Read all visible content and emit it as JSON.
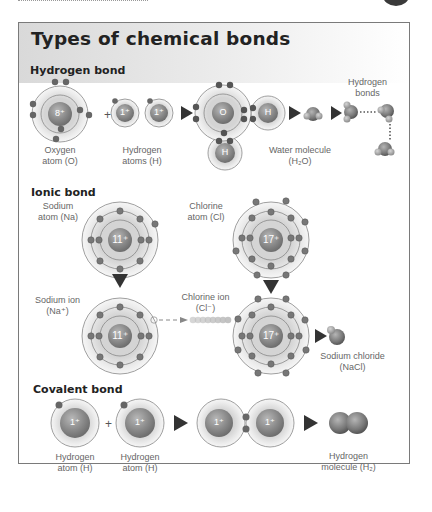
{
  "title": "Types of chemical bonds",
  "sections": {
    "hydrogen": {
      "heading": "Hydrogen bond",
      "labels": {
        "oxygen_atom": [
          "Oxygen",
          "atom (O)"
        ],
        "hydrogen_atoms": [
          "Hydrogen",
          "atoms (H)"
        ],
        "water_molecule": [
          "Water molecule",
          "(H₂O)"
        ],
        "hydrogen_bonds": [
          "Hydrogen",
          "bonds"
        ]
      },
      "nuclei": {
        "oxygen": "8⁺",
        "hydrogen1": "1⁺",
        "hydrogen2": "1⁺",
        "o": "O",
        "h_right": "H",
        "h_bottom": "H"
      },
      "operator": "+"
    },
    "ionic": {
      "heading": "Ionic bond",
      "labels": {
        "sodium_atom": [
          "Sodium",
          "atom (Na)"
        ],
        "chlorine_atom": [
          "Chlorine",
          "atom (Cl)"
        ],
        "sodium_ion": [
          "Sodium ion",
          "(Na⁺)"
        ],
        "chlorine_ion": [
          "Chlorine ion",
          "(Cl⁻)"
        ],
        "sodium_chloride": [
          "Sodium chloride",
          "(NaCl)"
        ]
      },
      "nuclei": {
        "sodium": "11⁺",
        "chlorine": "17⁺",
        "sodium_ion": "11⁺",
        "chlorine_ion": "17⁺"
      }
    },
    "covalent": {
      "heading": "Covalent bond",
      "labels": {
        "hydrogen_atom_1": [
          "Hydrogen",
          "atom (H)"
        ],
        "hydrogen_atom_2": [
          "Hydrogen",
          "atom (H)"
        ],
        "hydrogen_molecule": [
          "Hydrogen",
          "molecule (H₂)"
        ]
      },
      "nuclei": {
        "h1": "1⁺",
        "h2": "1⁺",
        "h3": "1⁺",
        "h4": "1⁺"
      },
      "operator": "+"
    }
  },
  "colors": {
    "nucleus": "#8a8a8a",
    "electron": "#6b6b6b",
    "shell_fill": "#e6e6e6",
    "arrow": "#3a3a3a",
    "border": "#7a7a7a"
  }
}
